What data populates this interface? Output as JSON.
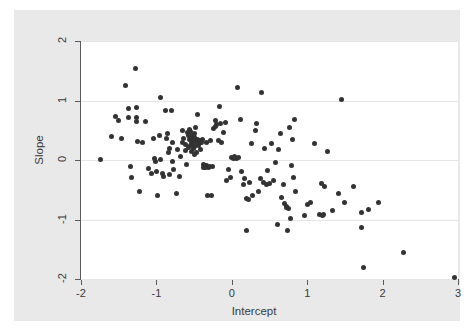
{
  "chart_data": {
    "type": "scatter",
    "title": "",
    "xlabel": "Intercept",
    "ylabel": "Slope",
    "xlim": [
      -2.0,
      3.0
    ],
    "ylim": [
      -2.0,
      2.0
    ],
    "xticks": [
      -2,
      -1,
      0,
      1,
      2,
      3
    ],
    "yticks": [
      -2,
      -1,
      0,
      1,
      2
    ],
    "xtick_labels": [
      "-2",
      "-1",
      "0",
      "1",
      "2",
      "3"
    ],
    "ytick_labels": [
      "-2",
      "-1",
      "0",
      "1",
      "2"
    ],
    "grid": "horizontal",
    "legend": "none",
    "marker": {
      "shape": "circle",
      "color": "#333333",
      "size": 5
    },
    "background_color": "#e9e9e9",
    "plot_background_color": "#ffffff",
    "gridline_color": "#e6e6e6",
    "axis_color": "#5a5a5a",
    "n_points": 173,
    "points": [
      [
        -1.74,
        0.01
      ],
      [
        -1.59,
        0.4
      ],
      [
        -1.54,
        0.73
      ],
      [
        -1.5,
        0.66
      ],
      [
        -1.46,
        0.36
      ],
      [
        -1.41,
        1.26
      ],
      [
        -1.37,
        0.87
      ],
      [
        -1.37,
        0.71
      ],
      [
        -1.35,
        -0.11
      ],
      [
        -1.33,
        -0.3
      ],
      [
        -1.28,
        1.54
      ],
      [
        -1.26,
        0.88
      ],
      [
        -1.26,
        0.72
      ],
      [
        -1.25,
        0.31
      ],
      [
        -1.26,
        0.64
      ],
      [
        -1.22,
        -0.53
      ],
      [
        -1.18,
        0.3
      ],
      [
        -1.14,
        0.65
      ],
      [
        -1.1,
        -0.15
      ],
      [
        -1.07,
        -0.22
      ],
      [
        -1.04,
        0.36
      ],
      [
        -1.02,
        0.03
      ],
      [
        -1.01,
        -0.02
      ],
      [
        -1.0,
        -0.19
      ],
      [
        -0.99,
        -0.6
      ],
      [
        -0.96,
        0.42
      ],
      [
        -0.95,
        1.05
      ],
      [
        -0.94,
        0.01
      ],
      [
        -0.92,
        -0.23
      ],
      [
        -0.9,
        -0.28
      ],
      [
        -0.88,
        0.83
      ],
      [
        -0.87,
        0.36
      ],
      [
        -0.85,
        0.44
      ],
      [
        -0.84,
        0.13
      ],
      [
        -0.83,
        0.19
      ],
      [
        -0.82,
        -0.25
      ],
      [
        -0.8,
        0.83
      ],
      [
        -0.79,
        -0.02
      ],
      [
        -0.78,
        0.3
      ],
      [
        -0.77,
        -0.16
      ],
      [
        -0.74,
        -0.57
      ],
      [
        -0.72,
        0.18
      ],
      [
        -0.7,
        -0.28
      ],
      [
        -0.68,
        0.06
      ],
      [
        -0.66,
        0.5
      ],
      [
        -0.65,
        0.3
      ],
      [
        -0.64,
        0.36
      ],
      [
        -0.62,
        0.26
      ],
      [
        -0.61,
        0.16
      ],
      [
        -0.6,
        -0.07
      ],
      [
        -0.59,
        0.46
      ],
      [
        -0.58,
        0.41
      ],
      [
        -0.57,
        0.21
      ],
      [
        -0.56,
        0.52
      ],
      [
        -0.56,
        0.34
      ],
      [
        -0.55,
        0.48
      ],
      [
        -0.55,
        0.24
      ],
      [
        -0.54,
        0.37
      ],
      [
        -0.53,
        0.3
      ],
      [
        -0.53,
        0.15
      ],
      [
        -0.52,
        0.42
      ],
      [
        -0.52,
        0.27
      ],
      [
        -0.51,
        0.33
      ],
      [
        -0.51,
        0.19
      ],
      [
        -0.5,
        0.45
      ],
      [
        -0.5,
        0.09
      ],
      [
        -0.49,
        0.38
      ],
      [
        -0.49,
        0.22
      ],
      [
        -0.48,
        0.55
      ],
      [
        -0.47,
        0.31
      ],
      [
        -0.47,
        0.12
      ],
      [
        -0.46,
        0.28
      ],
      [
        -0.45,
        0.76
      ],
      [
        -0.45,
        0.35
      ],
      [
        -0.44,
        0.25
      ],
      [
        -0.43,
        0.33
      ],
      [
        -0.42,
        0.3
      ],
      [
        -0.41,
        0.18
      ],
      [
        -0.4,
        0.3
      ],
      [
        -0.39,
        0.34
      ],
      [
        -0.38,
        -0.08
      ],
      [
        -0.37,
        -0.12
      ],
      [
        -0.36,
        -0.1
      ],
      [
        -0.35,
        -0.13
      ],
      [
        -0.34,
        -0.09
      ],
      [
        -0.33,
        0.3
      ],
      [
        -0.32,
        -0.59
      ],
      [
        -0.31,
        -0.13
      ],
      [
        -0.3,
        -0.11
      ],
      [
        -0.28,
        0.32
      ],
      [
        -0.27,
        -0.59
      ],
      [
        -0.26,
        -0.11
      ],
      [
        -0.24,
        0.53
      ],
      [
        -0.22,
        0.66
      ],
      [
        -0.21,
        0.57
      ],
      [
        -0.2,
        0.6
      ],
      [
        -0.18,
        0.33
      ],
      [
        -0.16,
        0.9
      ],
      [
        -0.15,
        0.62
      ],
      [
        -0.13,
        0.3
      ],
      [
        -0.11,
        0.46
      ],
      [
        -0.09,
        0.63
      ],
      [
        -0.07,
        -0.34
      ],
      [
        -0.05,
        -0.16
      ],
      [
        -0.02,
        -0.3
      ],
      [
        0.0,
        0.04
      ],
      [
        0.02,
        0.02
      ],
      [
        0.04,
        0.06
      ],
      [
        0.06,
        0.03
      ],
      [
        0.08,
        1.22
      ],
      [
        0.09,
        0.05
      ],
      [
        0.11,
        0.68
      ],
      [
        0.13,
        -0.2
      ],
      [
        0.15,
        -0.42
      ],
      [
        0.17,
        -0.31
      ],
      [
        0.19,
        -0.65
      ],
      [
        0.2,
        -1.19
      ],
      [
        0.22,
        -0.66
      ],
      [
        0.24,
        -0.37
      ],
      [
        0.26,
        0.28
      ],
      [
        0.28,
        -0.6
      ],
      [
        0.31,
        0.5
      ],
      [
        0.33,
        0.62
      ],
      [
        0.36,
        -0.53
      ],
      [
        0.38,
        -0.31
      ],
      [
        0.4,
        1.14
      ],
      [
        0.42,
        -0.38
      ],
      [
        0.44,
        0.19
      ],
      [
        0.46,
        -0.41
      ],
      [
        0.48,
        -0.18
      ],
      [
        0.5,
        -0.4
      ],
      [
        0.52,
        0.28
      ],
      [
        0.55,
        -0.35
      ],
      [
        0.58,
        -0.04
      ],
      [
        0.6,
        -1.09
      ],
      [
        0.62,
        0.17
      ],
      [
        0.64,
        0.44
      ],
      [
        0.66,
        -0.63
      ],
      [
        0.68,
        -0.41
      ],
      [
        0.7,
        -0.73
      ],
      [
        0.72,
        -0.79
      ],
      [
        0.73,
        -0.78
      ],
      [
        0.74,
        -1.18
      ],
      [
        0.75,
        -0.81
      ],
      [
        0.76,
        0.55
      ],
      [
        0.78,
        -0.99
      ],
      [
        0.79,
        -0.09
      ],
      [
        0.8,
        0.34
      ],
      [
        0.82,
        -0.3
      ],
      [
        0.83,
        0.68
      ],
      [
        0.85,
        -0.53
      ],
      [
        0.96,
        -0.93
      ],
      [
        1.0,
        -0.74
      ],
      [
        1.05,
        -0.71
      ],
      [
        1.1,
        0.28
      ],
      [
        1.16,
        -0.91
      ],
      [
        1.19,
        -0.4
      ],
      [
        1.2,
        -0.93
      ],
      [
        1.22,
        -0.92
      ],
      [
        1.23,
        -0.45
      ],
      [
        1.27,
        0.15
      ],
      [
        1.33,
        -0.85
      ],
      [
        1.42,
        -0.57
      ],
      [
        1.46,
        1.01
      ],
      [
        1.49,
        -0.71
      ],
      [
        1.62,
        -0.44
      ],
      [
        1.72,
        -0.88
      ],
      [
        1.72,
        -1.13
      ],
      [
        1.75,
        -1.81
      ],
      [
        1.81,
        -0.83
      ],
      [
        1.95,
        -0.71
      ],
      [
        2.28,
        -1.55
      ],
      [
        2.95,
        -1.98
      ]
    ]
  }
}
